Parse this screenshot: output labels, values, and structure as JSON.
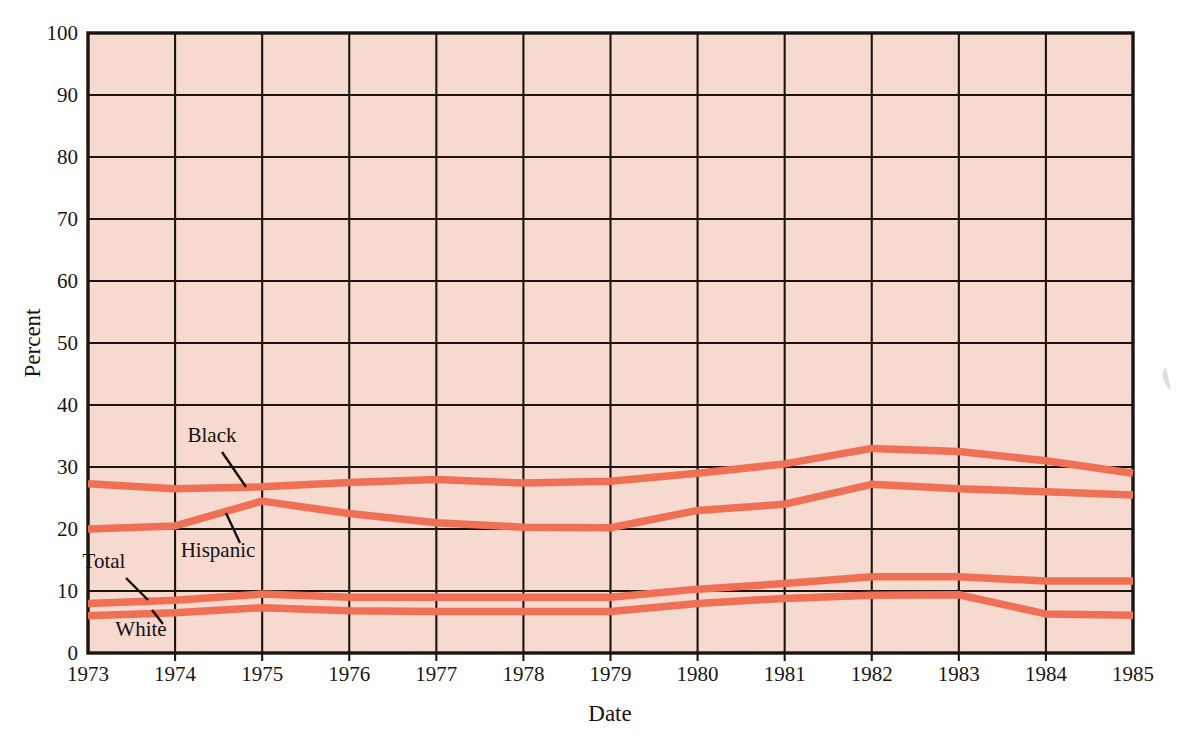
{
  "figure": {
    "background_color": "#ffffff",
    "plot_background_color": "#f6dad0",
    "line_color": "#ef7055",
    "axis_color": "#1c1410"
  },
  "chart_data": {
    "type": "line",
    "title": "",
    "xlabel": "Date",
    "ylabel": "Percent",
    "xlim": [
      1973,
      1985
    ],
    "ylim": [
      0,
      100
    ],
    "grid": true,
    "legend": "inline-labels",
    "x": [
      1973,
      1974,
      1975,
      1976,
      1977,
      1978,
      1979,
      1980,
      1981,
      1982,
      1983,
      1984,
      1985
    ],
    "xtick_labels": [
      "1973",
      "1974",
      "1975",
      "1976",
      "1977",
      "1978",
      "1979",
      "1980",
      "1981",
      "1982",
      "1983",
      "1984",
      "1985"
    ],
    "ytick_labels": [
      "0",
      "10",
      "20",
      "30",
      "40",
      "50",
      "60",
      "70",
      "80",
      "90",
      "100"
    ],
    "ytick_values": [
      0,
      10,
      20,
      30,
      40,
      50,
      60,
      70,
      80,
      90,
      100
    ],
    "series": [
      {
        "name": "Black",
        "values": [
          27.3,
          26.5,
          26.8,
          27.5,
          28.0,
          27.4,
          27.7,
          29.0,
          30.5,
          33.0,
          32.5,
          31.0,
          29.0
        ]
      },
      {
        "name": "Hispanic",
        "values": [
          20.0,
          20.5,
          24.5,
          22.5,
          21.0,
          20.3,
          20.2,
          23.0,
          24.0,
          27.2,
          26.5,
          26.0,
          25.5
        ]
      },
      {
        "name": "Total",
        "values": [
          8.0,
          8.5,
          9.5,
          9.0,
          9.0,
          9.0,
          9.0,
          10.3,
          11.2,
          12.3,
          12.3,
          11.6,
          11.6
        ]
      },
      {
        "name": "White",
        "values": [
          6.0,
          6.5,
          7.3,
          6.8,
          6.7,
          6.7,
          6.7,
          8.0,
          8.8,
          9.3,
          9.4,
          6.3,
          6.1
        ]
      }
    ],
    "annotations": [
      {
        "label": "Black",
        "text_x": 212,
        "text_y": 442,
        "leader": [
          [
            222,
            452
          ],
          [
            246,
            487
          ]
        ]
      },
      {
        "label": "Hispanic",
        "text_x": 218,
        "text_y": 557,
        "leader": [
          [
            240,
            543
          ],
          [
            226,
            513
          ]
        ]
      },
      {
        "label": "Total",
        "text_x": 104,
        "text_y": 568,
        "leader": [
          [
            126,
            578
          ],
          [
            148,
            600
          ]
        ]
      },
      {
        "label": "White",
        "text_x": 141,
        "text_y": 636,
        "leader": [
          [
            163,
            624
          ],
          [
            152,
            610
          ]
        ]
      }
    ]
  }
}
